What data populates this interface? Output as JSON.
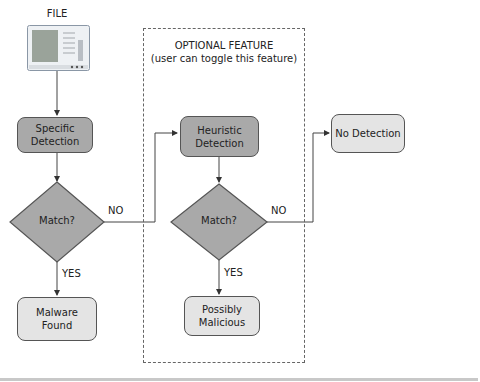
{
  "diagram": {
    "file_label": "FILE",
    "optional_group": {
      "title": "OPTIONAL FEATURE",
      "subtitle": "(user can toggle this feature)"
    },
    "nodes": {
      "specific_detection": "Specific\nDetection",
      "match_1": "Match?",
      "malware_found": "Malware\nFound",
      "heuristic_detection": "Heuristic\nDetection",
      "match_2": "Match?",
      "possibly_malicious": "Possibly\nMalicious",
      "no_detection": "No Detection"
    },
    "edge_labels": {
      "no_1": "NO",
      "yes_1": "YES",
      "no_2": "NO",
      "yes_2": "YES"
    },
    "colors": {
      "dark_fill": "#a9a9a9",
      "light_fill": "#e4e4e4",
      "stroke": "#555555"
    }
  }
}
